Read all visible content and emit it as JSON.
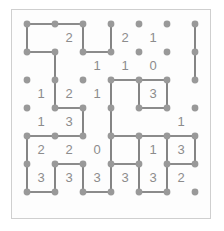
{
  "puzzle": {
    "type": "slitherlink",
    "title": "Slitherlink solution grid",
    "rows": 6,
    "cols": 6,
    "dot_rows": 7,
    "dot_cols": 7,
    "colors": {
      "background": "#ffffff",
      "board_background": "#fdfdfd",
      "border": "#cfcfcf",
      "dot": "#999999",
      "line": "#666666",
      "clue_text": "#8c8c8c"
    },
    "geometry": {
      "origin_x": 27,
      "origin_y": 24,
      "spacing": 28,
      "dot_radius": 3.4,
      "line_width": 1.6,
      "frame": {
        "x": 11,
        "y": 9,
        "width": 200,
        "height": 210
      }
    },
    "clues": [
      [
        "",
        "2",
        "",
        "2",
        "1",
        ""
      ],
      [
        "",
        "",
        "1",
        "1",
        "0",
        ""
      ],
      [
        "1",
        "2",
        "1",
        "",
        "3",
        ""
      ],
      [
        "1",
        "3",
        "",
        "",
        "",
        "1"
      ],
      [
        "2",
        "2",
        "0",
        "",
        "1",
        "3"
      ],
      [
        "3",
        "3",
        "3",
        "3",
        "3",
        "2"
      ]
    ],
    "horizontal_edges": [
      [
        1,
        1,
        0,
        0,
        0,
        0
      ],
      [
        1,
        0,
        1,
        0,
        0,
        0
      ],
      [
        0,
        0,
        0,
        1,
        1,
        0
      ],
      [
        0,
        1,
        0,
        0,
        1,
        0
      ],
      [
        1,
        1,
        0,
        1,
        1,
        1
      ],
      [
        0,
        1,
        0,
        1,
        0,
        1
      ],
      [
        1,
        0,
        1,
        0,
        1,
        0
      ]
    ],
    "vertical_edges": [
      [
        1,
        0,
        1,
        1,
        0,
        0,
        1
      ],
      [
        0,
        1,
        0,
        0,
        0,
        0,
        1
      ],
      [
        0,
        1,
        0,
        1,
        1,
        1,
        0
      ],
      [
        0,
        0,
        1,
        1,
        0,
        0,
        0
      ],
      [
        1,
        0,
        0,
        1,
        1,
        1,
        1
      ],
      [
        1,
        1,
        1,
        1,
        1,
        1,
        0
      ]
    ]
  }
}
